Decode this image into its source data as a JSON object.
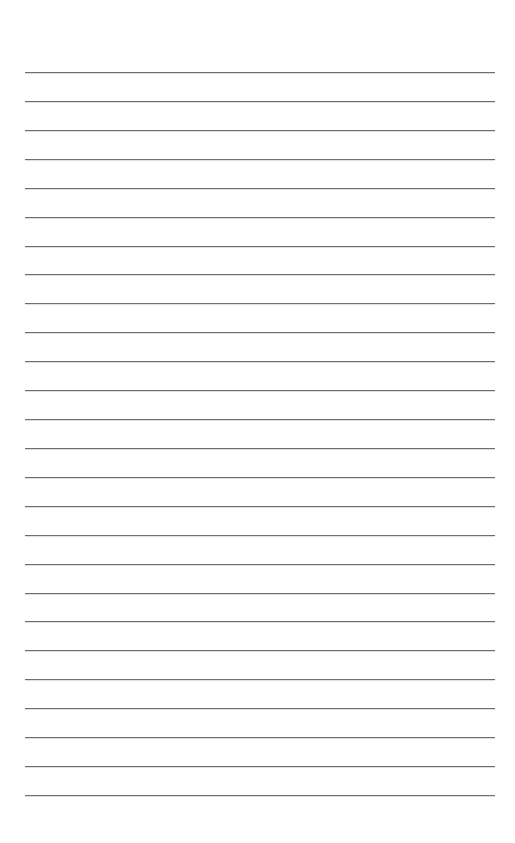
{
  "page": {
    "type": "lined-paper",
    "background_color": "#ffffff",
    "line_color": "#6e6e6e",
    "line_count": 26,
    "first_line_y": 72,
    "line_spacing": 28.92,
    "line_left": 25,
    "line_right": 495
  }
}
